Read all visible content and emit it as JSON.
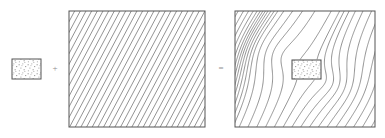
{
  "figure": {
    "background_color": "#ffffff",
    "line_color": "#6f6f6f",
    "border_color": "#555555",
    "stipple_color": "#9a9a9a",
    "operator_color": "#8e8e8e",
    "panels": [
      {
        "id": "inclusion",
        "name": "inclusion-patch",
        "role": "operand-1",
        "x": 12,
        "y": 59,
        "width": 29,
        "height": 20,
        "fill": "stipple",
        "description": "small stippled rectangular inclusion"
      },
      {
        "id": "uniform-field",
        "name": "uniform-hatch-field",
        "role": "operand-2",
        "x": 69,
        "y": 11,
        "width": 136,
        "height": 116,
        "fill": "diagonal-hatch",
        "hatch_angle_deg": 62,
        "hatch_spacing": 5.0,
        "line_count": 44,
        "description": "large box filled with evenly spaced parallel diagonal lines"
      },
      {
        "id": "perturbed-field",
        "name": "perturbed-streamline-field",
        "role": "result",
        "x": 235,
        "y": 11,
        "width": 140,
        "height": 116,
        "fill": "curved-streamlines",
        "line_count": 28,
        "description": "large box with streamlines deflected around an embedded inclusion",
        "inclusion": {
          "name": "embedded-inclusion",
          "x": 292,
          "y": 60,
          "width": 29,
          "height": 19,
          "fill": "stipple"
        }
      }
    ],
    "operators": [
      {
        "name": "plus-operator",
        "symbol": "+",
        "x": 55,
        "y": 69
      },
      {
        "name": "equals-operator",
        "symbol": "=",
        "x": 221,
        "y": 69
      }
    ]
  },
  "chart_data": {
    "type": "diagram",
    "elements": [
      {
        "label": "inclusion",
        "kind": "stippled-rectangle"
      },
      {
        "label": "uniform field",
        "kind": "hatched-box"
      },
      {
        "label": "perturbed field",
        "kind": "streamline-box-with-inclusion"
      }
    ],
    "operators": [
      "+",
      "="
    ]
  }
}
